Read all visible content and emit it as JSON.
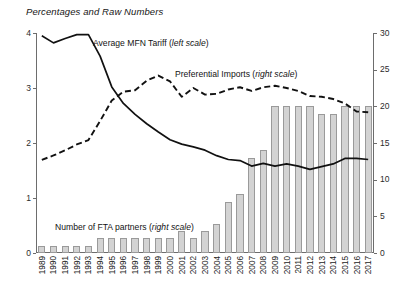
{
  "chart_data": {
    "type": "bar",
    "title": "Percentages and Raw Numbers",
    "xlabel": "",
    "ylabel": "",
    "grid": false,
    "legend_position": "inline-annotations",
    "categories": [
      "1989",
      "1990",
      "1991",
      "1992",
      "1993",
      "1994",
      "1995",
      "1996",
      "1997",
      "1998",
      "1999",
      "2000",
      "2001",
      "2002",
      "2003",
      "2004",
      "2005",
      "2006",
      "2007",
      "2008",
      "2009",
      "2010",
      "2011",
      "2012",
      "2013",
      "2014",
      "2015",
      "2016",
      "2017"
    ],
    "axes": {
      "left": {
        "label": "",
        "ticks": [
          "0",
          "1",
          "2",
          "3",
          "4"
        ],
        "values": [
          0,
          1,
          2,
          3,
          4
        ],
        "range": [
          0,
          4
        ],
        "scale_for": "Average MFN Tariff"
      },
      "right": {
        "label": "",
        "ticks": [
          "0",
          "5",
          "10",
          "15",
          "20",
          "25",
          "30"
        ],
        "values": [
          0,
          5,
          10,
          15,
          20,
          25,
          30
        ],
        "range": [
          0,
          30
        ],
        "scale_for": "Preferential Imports and Number of FTA partners"
      }
    },
    "series": [
      {
        "name": "Number of FTA partners (right scale)",
        "type": "bar",
        "axis": "right",
        "color": "#d3d3d3",
        "values": [
          1,
          1,
          1,
          1,
          1,
          2,
          2,
          2,
          2,
          2,
          2,
          2,
          3,
          2,
          3,
          4,
          7,
          8,
          13,
          14,
          20,
          20,
          20,
          20,
          19,
          19,
          20,
          20,
          20
        ]
      },
      {
        "name": "Average MFN Tariff (left scale)",
        "type": "line",
        "axis": "left",
        "style": "solid",
        "color": "#111111",
        "values": [
          3.95,
          3.82,
          3.9,
          3.97,
          3.97,
          3.58,
          3.02,
          2.72,
          2.52,
          2.35,
          2.2,
          2.06,
          1.98,
          1.93,
          1.87,
          1.77,
          1.7,
          1.68,
          1.58,
          1.63,
          1.58,
          1.62,
          1.58,
          1.52,
          1.57,
          1.62,
          1.72,
          1.72,
          1.7
        ]
      },
      {
        "name": "Preferential Imports (right scale)",
        "type": "line",
        "axis": "right",
        "style": "dashed",
        "color": "#111111",
        "values": [
          12.7,
          13.3,
          14.0,
          14.8,
          15.4,
          18.0,
          20.8,
          22.0,
          22.2,
          23.5,
          24.2,
          23.4,
          21.3,
          22.5,
          21.6,
          21.7,
          22.3,
          22.6,
          22.1,
          22.6,
          22.8,
          22.5,
          22.1,
          21.4,
          21.3,
          21.0,
          20.4,
          19.3,
          19.2
        ]
      }
    ],
    "annotations": [
      {
        "id": "mfn-label",
        "text_plain": "Average MFN Tariff (left scale)",
        "text_main": "Average MFN Tariff (",
        "text_italic": "left scale",
        "text_tail": ")"
      },
      {
        "id": "pref-label",
        "text_plain": "Preferential Imports (right scale)",
        "text_main": "Preferential Imports (",
        "text_italic": "right scale",
        "text_tail": ")"
      },
      {
        "id": "fta-label",
        "text_plain": "Number of FTA partners (right scale)",
        "text_main": "Number of FTA partners (",
        "text_italic": "right scale",
        "text_tail": ")"
      }
    ]
  }
}
